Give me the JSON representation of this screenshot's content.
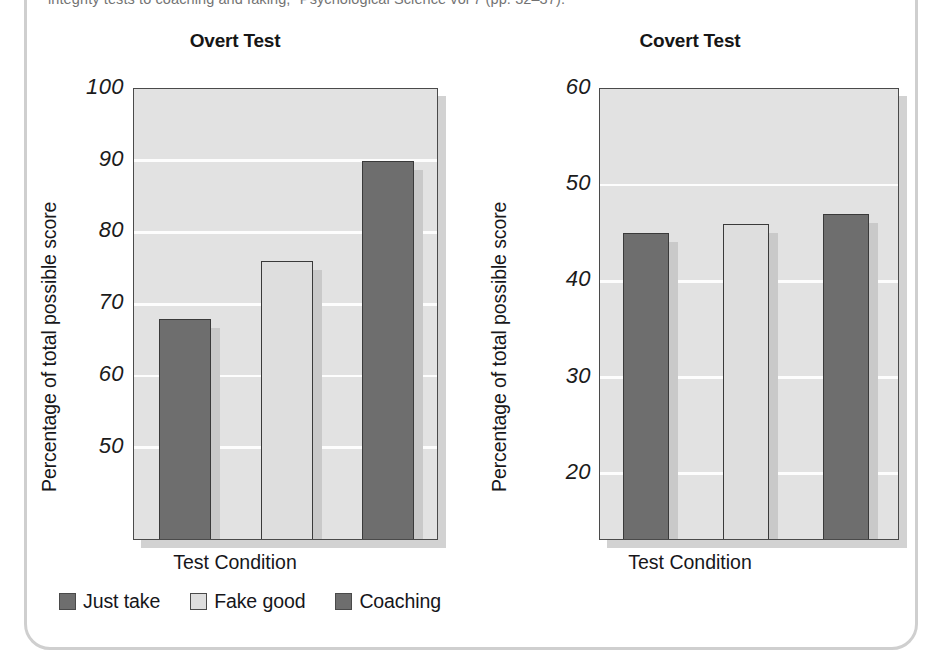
{
  "citation": {
    "text": "integrity tests to coaching and faking,\" Psychological Science vol 7 (pp. 32–37)."
  },
  "colors": {
    "plot_background": "#e2e2e2",
    "gridline": "#fdfdfd",
    "axis": "#4a4a4a",
    "bar_dark": "#6e6e6e",
    "bar_light": "#dcdcdc",
    "text": "#16161a",
    "frame": "#cfcfcf"
  },
  "legend": {
    "items": [
      {
        "label": "Just take",
        "color": "#6e6e6e"
      },
      {
        "label": "Fake good",
        "color": "#dedede"
      },
      {
        "label": "Coaching",
        "color": "#6e6e6e"
      }
    ]
  },
  "chart_data": [
    {
      "type": "bar",
      "title": "Overt Test",
      "xlabel": "Test Condition",
      "ylabel": "Percentage of total possible score",
      "categories": [
        "Just take",
        "Fake good",
        "Coaching"
      ],
      "values": [
        68,
        76,
        90
      ],
      "colors": [
        "#6e6e6e",
        "#dedede",
        "#6e6e6e"
      ],
      "ylim": [
        37,
        100
      ],
      "yticks": [
        100,
        90,
        80,
        70,
        60,
        50
      ],
      "grid": true,
      "legend_position": "bottom"
    },
    {
      "type": "bar",
      "title": "Covert Test",
      "xlabel": "Test  Condition",
      "ylabel": "Percentage of total possible score",
      "categories": [
        "Just take",
        "Fake good",
        "Coaching"
      ],
      "values": [
        45,
        46,
        47
      ],
      "colors": [
        "#6e6e6e",
        "#dedede",
        "#6e6e6e"
      ],
      "ylim": [
        13,
        60
      ],
      "yticks": [
        60,
        50,
        40,
        30,
        20
      ],
      "grid": true,
      "legend_position": "bottom"
    }
  ]
}
